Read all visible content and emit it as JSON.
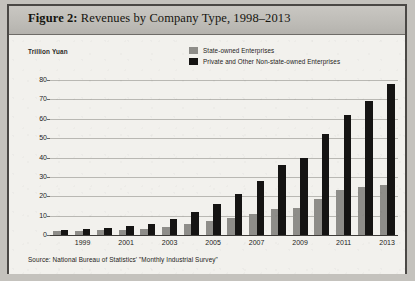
{
  "figure": {
    "label": "Figure 2:",
    "title": "Revenues by Company Type, 1998–2013",
    "full_title": "Figure 2: Revenues by Company Type, 1998–2013"
  },
  "axis": {
    "ylabel": "Trillion Yuan",
    "yticks": [
      "80",
      "70",
      "60",
      "50",
      "40",
      "30",
      "20",
      "10",
      "0"
    ],
    "xticks_visible": [
      "1999",
      "2001",
      "2003",
      "2005",
      "2007",
      "2009",
      "2011",
      "2013"
    ]
  },
  "legend": {
    "items": [
      {
        "label": "State-owned Enterprises",
        "color": "#8e8d89",
        "swatch": "gray-square-icon"
      },
      {
        "label": "Private and Other Non-state-owned Enterprises",
        "color": "#151413",
        "swatch": "black-square-icon"
      }
    ]
  },
  "source": {
    "text": "Source: National Bureau of Statistics' \"Monthly Industrial Survey\""
  },
  "colors": {
    "state_owned": "#8e8d89",
    "private": "#151413",
    "page": "#efeeea",
    "title_band": "#bdbbb6",
    "border": "#4a4845",
    "gridline": "#b9b8b3"
  },
  "chart_data": {
    "type": "bar",
    "title": "Figure 2: Revenues by Company Type, 1998–2013",
    "xlabel": "",
    "ylabel": "Trillion Yuan",
    "ylim": [
      0,
      80
    ],
    "ytick_interval": 10,
    "grid": true,
    "legend_position": "top-center",
    "categories": [
      "1998",
      "1999",
      "2000",
      "2001",
      "2002",
      "2003",
      "2004",
      "2005",
      "2006",
      "2007",
      "2008",
      "2009",
      "2010",
      "2011",
      "2012",
      "2013"
    ],
    "series": [
      {
        "name": "State-owned Enterprises",
        "color": "#8e8d89",
        "values": [
          2.0,
          2.2,
          2.6,
          2.8,
          3.2,
          4.2,
          5.6,
          7.0,
          8.6,
          10.6,
          13.6,
          14.0,
          18.6,
          23.2,
          24.6,
          26.0
        ]
      },
      {
        "name": "Private and Other Non-state-owned Enterprises",
        "color": "#151413",
        "values": [
          2.6,
          3.0,
          3.8,
          4.4,
          5.6,
          8.2,
          12.0,
          15.8,
          21.2,
          28.0,
          36.0,
          40.0,
          52.0,
          62.0,
          69.0,
          78.0
        ]
      }
    ]
  }
}
